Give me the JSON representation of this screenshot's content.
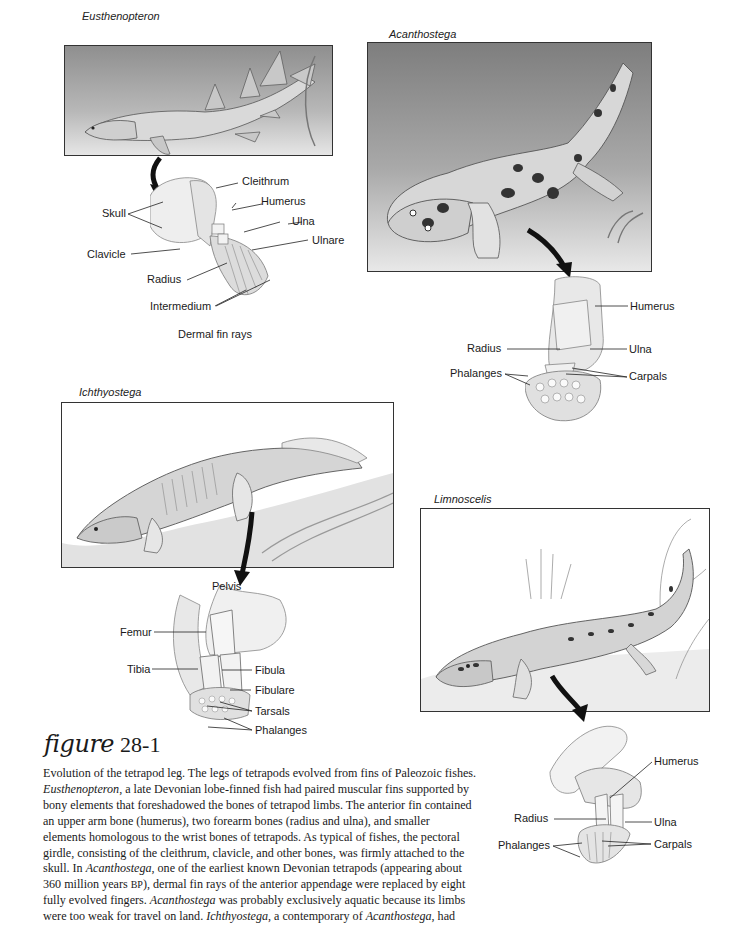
{
  "panels": {
    "eusthenopteron": {
      "title": "Eusthenopteron",
      "labels": {
        "cleithrum": "Cleithrum",
        "skull": "Skull",
        "humerus": "Humerus",
        "ulna": "Ulna",
        "ulnare": "Ulnare",
        "clavicle": "Clavicle",
        "radius": "Radius",
        "intermedium": "Intermedium",
        "dermal_fin_rays": "Dermal fin rays"
      }
    },
    "acanthostega": {
      "title": "Acanthostega",
      "labels": {
        "humerus": "Humerus",
        "radius": "Radius",
        "ulna": "Ulna",
        "phalanges": "Phalanges",
        "carpals": "Carpals"
      }
    },
    "ichthyostega": {
      "title": "Ichthyostega",
      "labels": {
        "pelvis": "Pelvis",
        "femur": "Femur",
        "tibia": "Tibia",
        "fibula": "Fibula",
        "fibulare": "Fibulare",
        "tarsals": "Tarsals",
        "phalanges": "Phalanges"
      }
    },
    "limnoscelis": {
      "title": "Limnoscelis",
      "labels": {
        "humerus": "Humerus",
        "radius": "Radius",
        "ulna": "Ulna",
        "phalanges": "Phalanges",
        "carpals": "Carpals"
      }
    }
  },
  "figure": {
    "word": "figure",
    "number": "28-1"
  },
  "caption": {
    "lines": [
      [
        "Evolution of the tetrapod leg. The legs of tetrapods evolved from fins of Paleozoic fishes."
      ],
      [
        "Eusthenopteron",
        ", a late Devonian lobe-finned fish had paired muscular fins supported by"
      ],
      [
        "bony elements that foreshadowed the bones of tetrapod limbs. The anterior fin contained"
      ],
      [
        "an upper arm bone (humerus), two forearm bones (radius and ulna), and smaller"
      ],
      [
        "elements homologous to the wrist bones of tetrapods. As typical of fishes, the pectoral"
      ],
      [
        "girdle, consisting of the cleithrum, clavicle, and other bones, was firmly attached to the"
      ],
      [
        "skull. In ",
        "Acanthostega",
        ", one of the earliest known Devonian tetrapods (appearing about"
      ],
      [
        "360 million years ",
        "BP",
        "), dermal fin rays of the anterior appendage were replaced by eight"
      ],
      [
        "fully evolved fingers. ",
        "Acanthostega",
        " was probably exclusively aquatic because its limbs"
      ],
      [
        "were too weak for travel on land. ",
        "Ichthyostega",
        ", a contemporary of ",
        "Acanthostega",
        ", had"
      ]
    ],
    "l0": "Evolution of the tetrapod leg. The legs of tetrapods evolved from fins of Paleozoic fishes.",
    "l1a": "Eusthenopteron",
    "l1b": ", a late Devonian lobe-finned fish had paired muscular fins supported by",
    "l2": "bony elements that foreshadowed the bones of tetrapod limbs. The anterior fin contained",
    "l3": "an upper arm bone (humerus), two forearm bones (radius and ulna), and smaller",
    "l4": "elements homologous to the wrist bones of tetrapods. As typical of fishes, the pectoral",
    "l5": "girdle, consisting of the cleithrum, clavicle, and other bones, was firmly attached to the",
    "l6a": "skull. In ",
    "l6b": "Acanthostega",
    "l6c": ", one of the earliest known Devonian tetrapods (appearing about",
    "l7a": "360 million years ",
    "l7b": "BP",
    "l7c": "), dermal fin rays of the anterior appendage were replaced by eight",
    "l8a": "fully evolved fingers. ",
    "l8b": "Acanthostega",
    "l8c": " was probably exclusively aquatic because its limbs",
    "l9a": "were too weak for travel on land. ",
    "l9b": "Ichthyostega",
    "l9c": ", a contemporary of ",
    "l9d": "Acanthostega",
    "l9e": ", had"
  }
}
